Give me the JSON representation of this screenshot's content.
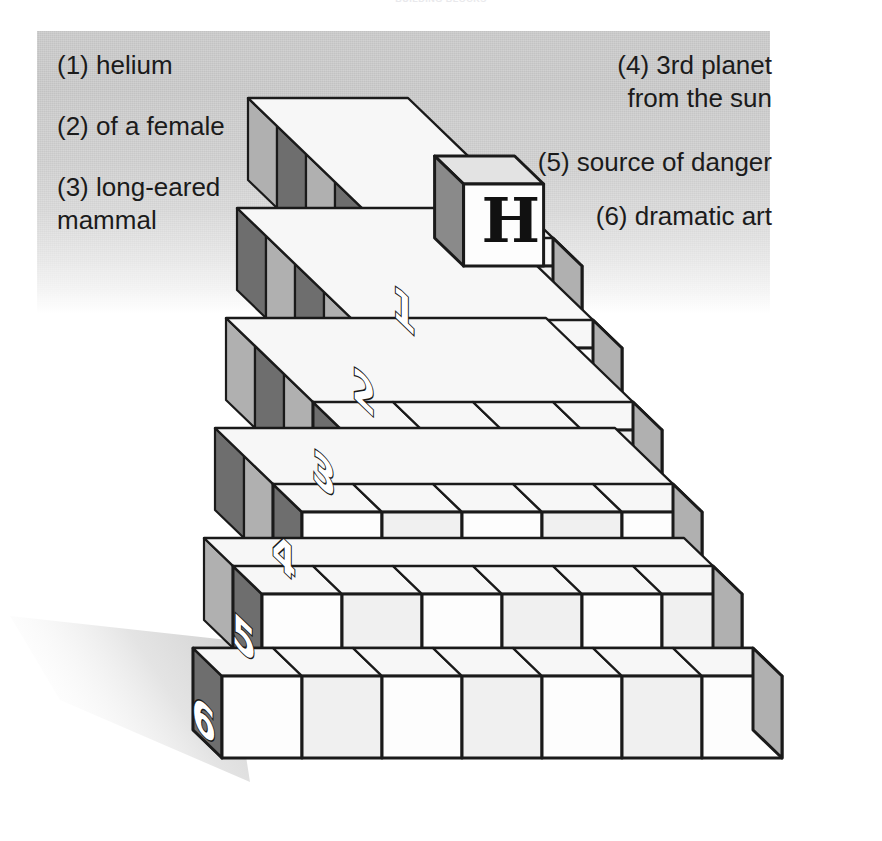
{
  "title": "BUILDING BLOCKS",
  "clues": {
    "left": [
      {
        "id": "clue-1",
        "text": "(1) helium"
      },
      {
        "id": "clue-2",
        "text": "(2) of a female"
      },
      {
        "id": "clue-3",
        "text": "(3) long-eared\n      mammal"
      }
    ],
    "right": [
      {
        "id": "clue-4",
        "text": "(4) 3rd planet\nfrom the sun"
      },
      {
        "id": "clue-5",
        "text": "(5) source of danger"
      },
      {
        "id": "clue-6",
        "text": "(6) dramatic art"
      }
    ]
  },
  "pyramid": {
    "apex_letter": "H",
    "row_labels": [
      "1",
      "2",
      "3",
      "4",
      "5",
      "6"
    ],
    "row_block_counts": [
      2,
      3,
      4,
      5,
      6,
      7
    ],
    "rows": 6
  },
  "colors": {
    "panel_gray": "#c3c3c3",
    "block_front": "#fdfdfd",
    "block_front_alt": "#f0f0f0",
    "block_top": "#f7f7f7",
    "side_light": "#b0b0b0",
    "side_dark": "#6e6e6e",
    "outline": "#1a1a1a",
    "shadow": "#d9d9d9",
    "number_fill": "#ffffff",
    "number_stroke": "#1a1a1a"
  }
}
